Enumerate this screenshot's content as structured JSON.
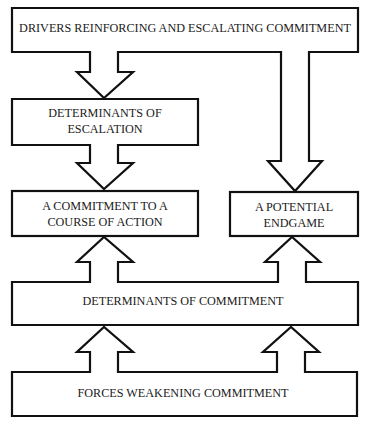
{
  "diagram": {
    "colors": {
      "background": "#ffffff",
      "stroke": "#111111",
      "text": "#1a1a1a"
    },
    "boxes": {
      "drivers": {
        "line1": "DRIVERS REINFORCING AND ESCALATING COMMITMENT"
      },
      "determinants_escalation": {
        "line1": "DETERMINANTS OF",
        "line2": "ESCALATION"
      },
      "commitment_course": {
        "line1": "A COMMITMENT TO A",
        "line2": "COURSE OF ACTION"
      },
      "potential_endgame": {
        "line1": "A POTENTIAL",
        "line2": "ENDGAME"
      },
      "determinants_commitment": {
        "line1": "DETERMINANTS OF COMMITMENT"
      },
      "forces_weakening": {
        "line1": "FORCES WEAKENING COMMITMENT"
      }
    },
    "connections": [
      {
        "from": "DRIVERS REINFORCING AND ESCALATING COMMITMENT",
        "to": "DETERMINANTS OF ESCALATION",
        "direction": "down"
      },
      {
        "from": "DRIVERS REINFORCING AND ESCALATING COMMITMENT",
        "to": "A POTENTIAL ENDGAME",
        "direction": "down"
      },
      {
        "from": "DETERMINANTS OF ESCALATION",
        "to": "A COMMITMENT TO A COURSE OF ACTION",
        "direction": "down"
      },
      {
        "from": "DETERMINANTS OF COMMITMENT",
        "to": "A COMMITMENT TO A COURSE OF ACTION",
        "direction": "up"
      },
      {
        "from": "DETERMINANTS OF COMMITMENT",
        "to": "A POTENTIAL ENDGAME",
        "direction": "up"
      },
      {
        "from": "FORCES WEAKENING COMMITMENT",
        "to": "DETERMINANTS OF COMMITMENT",
        "direction": "up"
      },
      {
        "from": "FORCES WEAKENING COMMITMENT",
        "to": "DETERMINANTS OF COMMITMENT",
        "direction": "up"
      }
    ]
  }
}
